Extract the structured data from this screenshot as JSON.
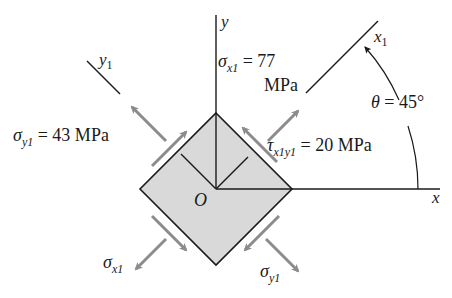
{
  "figure": {
    "type": "stress-element-rotated",
    "colors": {
      "background": "#ffffff",
      "lines": "#1a1a1a",
      "element_fill": "#d9d9d9",
      "arrows": "#8c8c8c"
    },
    "axes": {
      "x": "x",
      "y": "y",
      "x1": "x",
      "x1_sub": "1",
      "y1": "y",
      "y1_sub": "1",
      "origin": "O"
    },
    "labels": {
      "sigma_x1": {
        "symbol": "σ",
        "sub": "x1",
        "eq": " = 77",
        "unit": "MPa"
      },
      "sigma_y1": {
        "symbol": "σ",
        "sub": "y1",
        "eq": " = 43 MPa"
      },
      "tau_x1y1": {
        "symbol": "τ",
        "sub": "x1y1",
        "eq": " = 20 MPa"
      },
      "theta": {
        "symbol": "θ",
        "eq": " = 45°"
      },
      "sigma_x1_bottom": {
        "symbol": "σ",
        "sub": "x1"
      },
      "sigma_y1_bottom": {
        "symbol": "σ",
        "sub": "y1"
      }
    },
    "values": {
      "sigma_x1_MPa": 77,
      "sigma_y1_MPa": 43,
      "tau_x1y1_MPa": 20,
      "theta_deg": 45
    }
  }
}
